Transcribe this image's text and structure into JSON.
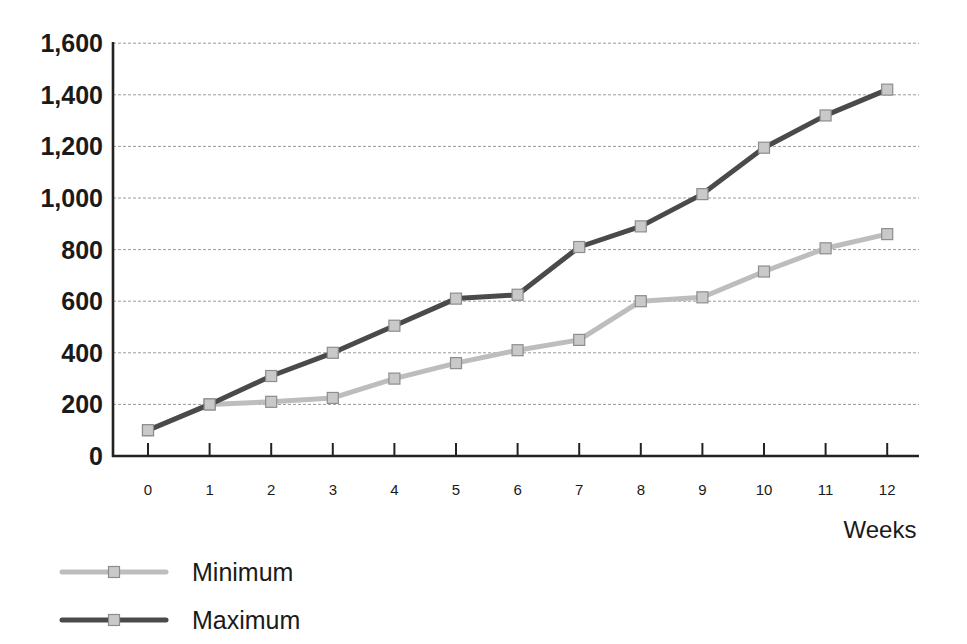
{
  "chart_data": {
    "type": "line",
    "title": "",
    "xlabel": "Weeks",
    "ylabel": "",
    "x": [
      0,
      1,
      2,
      3,
      4,
      5,
      6,
      7,
      8,
      9,
      10,
      11,
      12
    ],
    "xtick_labels": [
      "0",
      "1",
      "2",
      "3",
      "4",
      "5",
      "6",
      "7",
      "8",
      "9",
      "10",
      "11",
      "12"
    ],
    "ytick_labels": [
      "0",
      "200",
      "400",
      "600",
      "800",
      "1,000",
      "1,200",
      "1,400",
      "1,600"
    ],
    "yticks": [
      0,
      200,
      400,
      600,
      800,
      1000,
      1200,
      1400,
      1600
    ],
    "ylim": [
      0,
      1600
    ],
    "xlim": [
      0,
      12
    ],
    "grid": "horizontal-dotted",
    "legend_position": "bottom-left",
    "series": [
      {
        "name": "Minimum",
        "color": "#bdbdbd",
        "marker": "square",
        "marker_color": "#c9c9c9",
        "values": [
          100,
          200,
          210,
          225,
          300,
          360,
          410,
          450,
          600,
          615,
          715,
          805,
          860
        ]
      },
      {
        "name": "Maximum",
        "color": "#4a4a4a",
        "marker": "square",
        "marker_color": "#c9c9c9",
        "values": [
          100,
          200,
          310,
          400,
          505,
          610,
          625,
          810,
          890,
          1015,
          1195,
          1320,
          1420
        ]
      }
    ]
  },
  "legend": {
    "items": [
      {
        "label": "Minimum"
      },
      {
        "label": "Maximum"
      }
    ]
  },
  "axis": {
    "x_title": "Weeks"
  },
  "colors": {
    "axis": "#222222",
    "grid": "#9a9a9a",
    "minimum": "#bdbdbd",
    "maximum": "#4a4a4a",
    "marker_fill": "#c9c9c9",
    "marker_stroke": "#8d8d8d"
  }
}
